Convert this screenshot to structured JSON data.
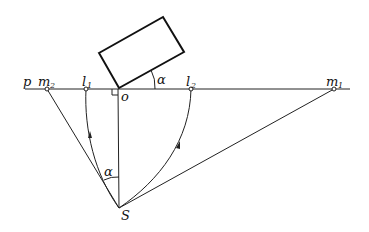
{
  "diagram": {
    "type": "geometric-construction",
    "labels": {
      "p": "p",
      "m2_main": "m",
      "m2_sub": "2",
      "l1_main": "l",
      "l1_sub": "1",
      "o": "o",
      "alpha_top": "α",
      "l2_main": "l",
      "l2_sub": "2",
      "m1_main": "m",
      "m1_sub": "1",
      "alpha_bottom": "α",
      "s": "S"
    },
    "points": {
      "m2": [
        47,
        89
      ],
      "l1": [
        86,
        89
      ],
      "o": [
        118,
        89
      ],
      "l2": [
        191,
        89
      ],
      "m1": [
        334,
        89
      ],
      "s": [
        119,
        208
      ]
    },
    "rectangle": [
      [
        99,
        53
      ],
      [
        163,
        17
      ],
      [
        184,
        52
      ],
      [
        119,
        88
      ]
    ],
    "horizon_line": [
      [
        25,
        89
      ],
      [
        350,
        89
      ]
    ]
  }
}
